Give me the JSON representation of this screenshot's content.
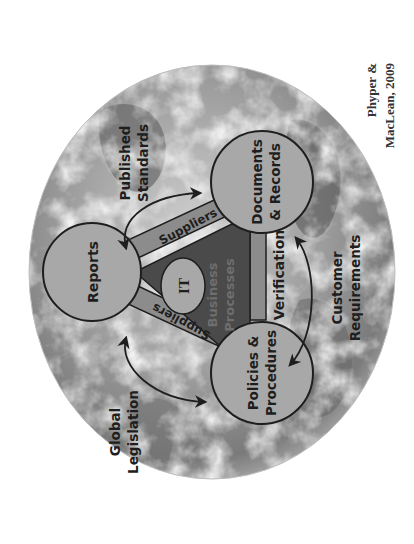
{
  "diagram": {
    "center": {
      "triangle_label_line1": "Business",
      "triangle_label_line2": "Processes",
      "core_label": "IT"
    },
    "nodes": [
      {
        "id": "reports",
        "label_lines": [
          "Reports"
        ]
      },
      {
        "id": "documents_records",
        "label_lines": [
          "Documents",
          "& Records"
        ]
      },
      {
        "id": "policies_procedures",
        "label_lines": [
          "Policies &",
          "Procedures"
        ]
      }
    ],
    "edges": [
      {
        "from": "reports",
        "to": "documents_records",
        "label": "Suppliers"
      },
      {
        "from": "reports",
        "to": "policies_procedures",
        "label": "Suppliers"
      },
      {
        "from": "documents_records",
        "to": "policies_procedures",
        "label": "Verification"
      }
    ],
    "external_influences": [
      {
        "label_lines": [
          "Published",
          "Standards"
        ],
        "between": [
          "reports",
          "documents_records"
        ]
      },
      {
        "label_lines": [
          "Global",
          "Legislation"
        ],
        "between": [
          "reports",
          "policies_procedures"
        ]
      },
      {
        "label_lines": [
          "Customer",
          "Requirements"
        ],
        "between": [
          "documents_records",
          "policies_procedures"
        ]
      }
    ],
    "citation_lines": [
      "Phyper &",
      "MacLean, 2009"
    ],
    "colors": {
      "background": "#ffffff",
      "globe_light": "#d9d9d9",
      "globe_mid": "#9a9a9a",
      "globe_dark": "#5a5a5a",
      "node_fill": "#a8a8a8",
      "band_fill": "#8c8c8c",
      "triangle_fill": "#4a4a4a",
      "outline": "#1e1e1e",
      "text": "#1e1e1e"
    }
  }
}
